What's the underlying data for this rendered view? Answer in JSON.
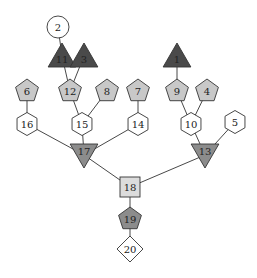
{
  "diagram": {
    "type": "tree-graph",
    "colors": {
      "white": "#ffffff",
      "light_gray": "#dcdcdc",
      "pent_gray": "#c8c8c8",
      "medium_gray": "#8c8c8c",
      "dark_gray": "#4a4a4a",
      "stroke": "#333333"
    },
    "nodes": [
      {
        "id": "2",
        "label": "2",
        "shape": "circle",
        "fill": "#ffffff",
        "x": 58,
        "y": 27
      },
      {
        "id": "11",
        "label": "11",
        "shape": "triangle-up",
        "fill": "#4a4a4a",
        "x": 62,
        "y": 56
      },
      {
        "id": "3",
        "label": "3",
        "shape": "triangle-up",
        "fill": "#4a4a4a",
        "x": 84,
        "y": 56
      },
      {
        "id": "1",
        "label": "1",
        "shape": "triangle-up",
        "fill": "#4a4a4a",
        "x": 177,
        "y": 56
      },
      {
        "id": "6",
        "label": "6",
        "shape": "pentagon",
        "fill": "#c8c8c8",
        "x": 27,
        "y": 91
      },
      {
        "id": "12",
        "label": "12",
        "shape": "pentagon",
        "fill": "#c8c8c8",
        "x": 70,
        "y": 91
      },
      {
        "id": "8",
        "label": "8",
        "shape": "pentagon",
        "fill": "#c8c8c8",
        "x": 107,
        "y": 91
      },
      {
        "id": "7",
        "label": "7",
        "shape": "pentagon",
        "fill": "#c8c8c8",
        "x": 138,
        "y": 91
      },
      {
        "id": "9",
        "label": "9",
        "shape": "pentagon",
        "fill": "#c8c8c8",
        "x": 177,
        "y": 91
      },
      {
        "id": "4",
        "label": "4",
        "shape": "pentagon",
        "fill": "#c8c8c8",
        "x": 207,
        "y": 91
      },
      {
        "id": "16",
        "label": "16",
        "shape": "hexagon",
        "fill": "#ffffff",
        "x": 27,
        "y": 124
      },
      {
        "id": "15",
        "label": "15",
        "shape": "hexagon",
        "fill": "#ffffff",
        "x": 82,
        "y": 124
      },
      {
        "id": "14",
        "label": "14",
        "shape": "hexagon",
        "fill": "#ffffff",
        "x": 138,
        "y": 124
      },
      {
        "id": "10",
        "label": "10",
        "shape": "hexagon",
        "fill": "#ffffff",
        "x": 191,
        "y": 124
      },
      {
        "id": "5",
        "label": "5",
        "shape": "hexagon",
        "fill": "#ffffff",
        "x": 235,
        "y": 122
      },
      {
        "id": "17",
        "label": "17",
        "shape": "triangle-down",
        "fill": "#8c8c8c",
        "x": 84,
        "y": 155
      },
      {
        "id": "13",
        "label": "13",
        "shape": "triangle-down",
        "fill": "#8c8c8c",
        "x": 205,
        "y": 155
      },
      {
        "id": "18",
        "label": "18",
        "shape": "square",
        "fill": "#dcdcdc",
        "x": 130,
        "y": 187
      },
      {
        "id": "19",
        "label": "19",
        "shape": "pentagon",
        "fill": "#8c8c8c",
        "x": 130,
        "y": 219
      },
      {
        "id": "20",
        "label": "20",
        "shape": "diamond",
        "fill": "#ffffff",
        "x": 130,
        "y": 249
      }
    ],
    "edges": [
      [
        "2",
        "11"
      ],
      [
        "11",
        "12"
      ],
      [
        "3",
        "12"
      ],
      [
        "1",
        "9"
      ],
      [
        "6",
        "16"
      ],
      [
        "12",
        "15"
      ],
      [
        "8",
        "15"
      ],
      [
        "7",
        "14"
      ],
      [
        "9",
        "10"
      ],
      [
        "4",
        "10"
      ],
      [
        "16",
        "17"
      ],
      [
        "15",
        "17"
      ],
      [
        "14",
        "17"
      ],
      [
        "10",
        "13"
      ],
      [
        "5",
        "13"
      ],
      [
        "17",
        "18"
      ],
      [
        "13",
        "18"
      ],
      [
        "18",
        "19"
      ],
      [
        "19",
        "20"
      ]
    ]
  }
}
